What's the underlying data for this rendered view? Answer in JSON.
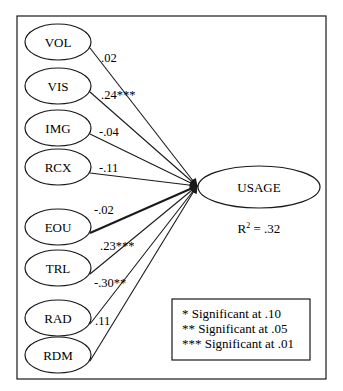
{
  "diagram": {
    "type": "path-model",
    "colors": {
      "stroke": "#1a1a1a",
      "background": "#ffffff",
      "text": "#1a1a1a"
    },
    "frame": {
      "x": 17,
      "y": 16,
      "width": 309,
      "height": 363
    },
    "predictors": [
      {
        "id": "VOL",
        "label": "VOL",
        "cx": 58,
        "cy": 42,
        "coefficient": ".02",
        "coef_x": 101,
        "coef_y": 62,
        "thick": false
      },
      {
        "id": "VIS",
        "label": "VIS",
        "cx": 58,
        "cy": 86,
        "coefficient": ".24***",
        "coef_x": 101,
        "coef_y": 99,
        "thick": false
      },
      {
        "id": "IMG",
        "label": "IMG",
        "cx": 58,
        "cy": 128,
        "coefficient": "-.04",
        "coef_x": 99,
        "coef_y": 136,
        "thick": false
      },
      {
        "id": "RCX",
        "label": "RCX",
        "cx": 58,
        "cy": 167,
        "coefficient": "-.11",
        "coef_x": 99,
        "coef_y": 172,
        "thick": false
      },
      {
        "id": "EOU",
        "label": "EOU",
        "cx": 58,
        "cy": 227,
        "coefficient": "-.02",
        "coef_x": 94,
        "coef_y": 214,
        "thick": true
      },
      {
        "id": "TRL",
        "label": "TRL",
        "cx": 58,
        "cy": 268,
        "coefficient": ".23***",
        "coef_x": 100,
        "coef_y": 250,
        "thick": false
      },
      {
        "id": "RAD",
        "label": "RAD",
        "cx": 58,
        "cy": 318,
        "coefficient": "-.30**",
        "coef_x": 94,
        "coef_y": 287,
        "thick": false
      },
      {
        "id": "RDM",
        "label": "RDM",
        "cx": 58,
        "cy": 355,
        "coefficient": ".11",
        "coef_x": 95,
        "coef_y": 325,
        "thick": false
      }
    ],
    "predictor_shape": {
      "rx": 33,
      "ry": 18
    },
    "outcome": {
      "label": "USAGE",
      "cx": 259,
      "cy": 187,
      "rx": 61,
      "ry": 21,
      "r_squared_label": "R",
      "r_squared_sup": "2",
      "r_squared_value": " = .32"
    },
    "arrow_target": {
      "x": 197,
      "y": 186
    },
    "legend": {
      "x": 172,
      "y": 299,
      "width": 138,
      "height": 61,
      "lines": [
        "* Significant at .10",
        "** Significant at .05",
        "*** Significant at .01"
      ]
    }
  }
}
